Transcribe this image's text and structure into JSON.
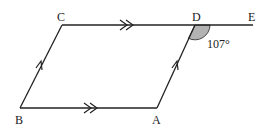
{
  "diagram": {
    "type": "geometry-parallelogram",
    "colors": {
      "stroke": "#222222",
      "angle_fill": "#b3b3b3",
      "text": "#222222",
      "background": "#ffffff"
    },
    "points": {
      "A": {
        "label": "A",
        "x": 157,
        "y": 108
      },
      "B": {
        "label": "B",
        "x": 20,
        "y": 108
      },
      "C": {
        "label": "C",
        "x": 62,
        "y": 25
      },
      "D": {
        "label": "D",
        "x": 195,
        "y": 25
      },
      "E": {
        "label": "E",
        "x": 253,
        "y": 25
      }
    },
    "segments": [
      {
        "from": "B",
        "to": "A",
        "marking": "double-arrow"
      },
      {
        "from": "C",
        "to": "E",
        "marking": "double-arrow (on CD)"
      },
      {
        "from": "B",
        "to": "C",
        "marking": "single-arrow"
      },
      {
        "from": "A",
        "to": "D",
        "marking": "single-arrow"
      }
    ],
    "angle": {
      "vertex": "D",
      "between": [
        "DA",
        "DE"
      ],
      "value_label": "107°",
      "shaded": true
    }
  }
}
